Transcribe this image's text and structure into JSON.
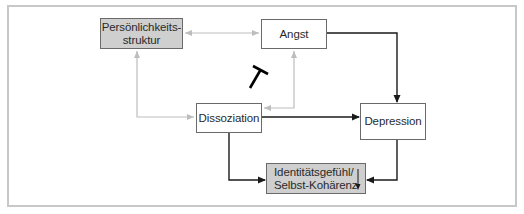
{
  "diagram": {
    "nodes": [
      {
        "id": "persoenlichkeit",
        "lines": [
          "Persönlichkeits-",
          "struktur"
        ],
        "style": "shaded"
      },
      {
        "id": "angst",
        "lines": [
          "Angst"
        ],
        "style": "plain"
      },
      {
        "id": "dissoziation",
        "lines": [
          "Dissoziation"
        ],
        "style": "plain"
      },
      {
        "id": "depression",
        "lines": [
          "Depression"
        ],
        "style": "plain"
      },
      {
        "id": "identitaet",
        "lines": [
          "Identitätsgefühl/",
          "Selbst-Kohärenz"
        ],
        "style": "shaded",
        "indicator": "decrease-arrow"
      }
    ],
    "edges": [
      {
        "from": "persoenlichkeit",
        "to": "angst",
        "type": "bidirectional",
        "color": "#bdbdbd"
      },
      {
        "from": "persoenlichkeit",
        "to": "dissoziation",
        "type": "bidirectional",
        "color": "#bdbdbd"
      },
      {
        "from": "angst",
        "to": "dissoziation",
        "type": "bidirectional",
        "color": "#bdbdbd"
      },
      {
        "from": "angst",
        "to": "depression",
        "type": "directed",
        "color": "#1a1a1a"
      },
      {
        "from": "dissoziation",
        "to": "depression",
        "type": "directed",
        "color": "#1a1a1a"
      },
      {
        "from": "dissoziation",
        "to": "identitaet",
        "type": "directed",
        "color": "#1a1a1a"
      },
      {
        "from": "depression",
        "to": "identitaet",
        "type": "directed",
        "color": "#1a1a1a"
      },
      {
        "from": "dissoziation",
        "to": "angst",
        "type": "inhibition",
        "color": "#000000"
      }
    ],
    "colors": {
      "shaded_fill": "#cfcfcf",
      "frame": "#c8c8c8",
      "gray_edge": "#bdbdbd",
      "black_edge": "#1a1a1a"
    }
  }
}
